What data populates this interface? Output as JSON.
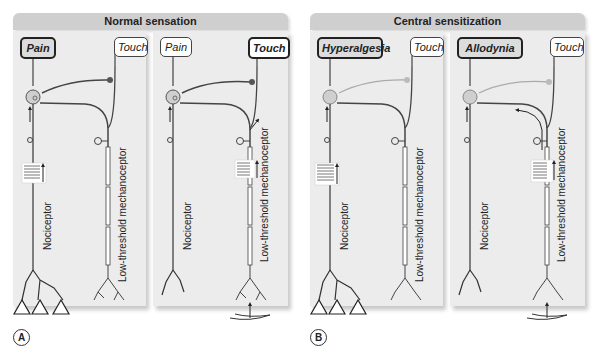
{
  "groups": [
    {
      "title": "Normal sensation",
      "letter": "A"
    },
    {
      "title": "Central sensitization",
      "letter": "B"
    }
  ],
  "panels": [
    {
      "left_label": "Pain",
      "right_label": "Touch",
      "active": "left",
      "nociceptor_label": "Nociceptor",
      "mechano_label": "Low-threshold mechanoceptor",
      "stimulus": "noxious",
      "inhibitory_active": true
    },
    {
      "left_label": "Pain",
      "right_label": "Touch",
      "active": "right",
      "nociceptor_label": "Nociceptor",
      "mechano_label": "Low-threshold mechanoceptor",
      "stimulus": "touch",
      "inhibitory_active": true
    },
    {
      "left_label": "Hyperalgesia",
      "right_label": "Touch",
      "active": "left",
      "nociceptor_label": "Nociceptor",
      "mechano_label": "Low-threshold mechanoceptor",
      "stimulus": "noxious",
      "inhibitory_active": false
    },
    {
      "left_label": "Allodynia",
      "right_label": "Touch",
      "active": "left",
      "nociceptor_label": "Nociceptor",
      "mechano_label": "Low-threshold mechanoceptor",
      "stimulus": "touch",
      "inhibitory_active": false
    }
  ],
  "stimulus_icons": [
    "mechanical-hazard-icon",
    "chemical-hazard-icon",
    "thermal-hazard-icon"
  ]
}
